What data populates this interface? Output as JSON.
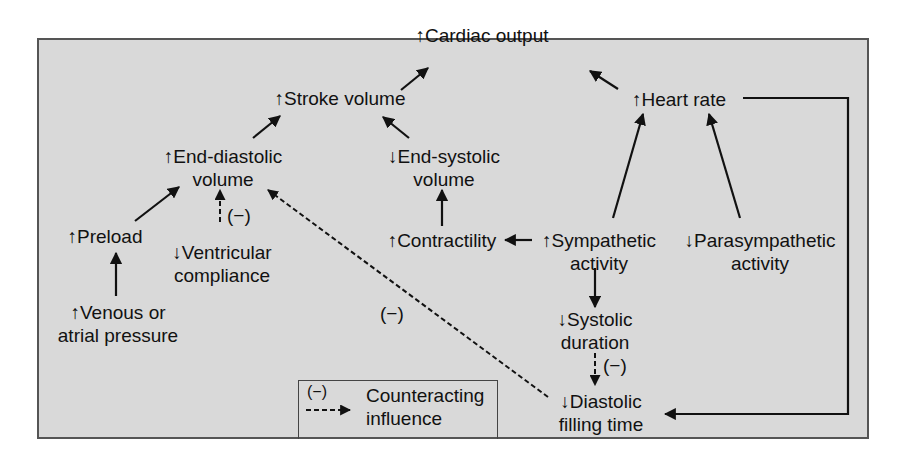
{
  "diagram": {
    "colors": {
      "background": "#d9d9d9",
      "frame_border": "#555555",
      "text": "#111111",
      "arrow": "#111111"
    },
    "nodes": {
      "cardiac_output": {
        "label": "↑Cardiac output"
      },
      "stroke_volume": {
        "label": "↑Stroke volume"
      },
      "heart_rate": {
        "label": "↑Heart rate"
      },
      "end_diastolic_volume": {
        "line1": "↑End-diastolic",
        "line2": "volume"
      },
      "end_systolic_volume": {
        "line1": "↓End-systolic",
        "line2": "volume"
      },
      "preload": {
        "label": "↑Preload"
      },
      "ventricular_compliance": {
        "line1": "↓Ventricular",
        "line2": "compliance"
      },
      "contractility": {
        "label": "↑Contractility"
      },
      "sympathetic_activity": {
        "line1": "↑Sympathetic",
        "line2": "activity"
      },
      "parasympathetic_activity": {
        "line1": "↓Parasympathetic",
        "line2": "activity"
      },
      "venous_pressure": {
        "line1": "↑Venous or",
        "line2": "atrial pressure"
      },
      "systolic_duration": {
        "line1": "↓Systolic",
        "line2": "duration"
      },
      "diastolic_filling_time": {
        "line1": "↓Diastolic",
        "line2": "filling time"
      }
    },
    "edges": [
      {
        "from": "stroke_volume",
        "to": "cardiac_output",
        "type": "solid"
      },
      {
        "from": "heart_rate",
        "to": "cardiac_output",
        "type": "solid"
      },
      {
        "from": "end_diastolic_volume",
        "to": "stroke_volume",
        "type": "solid"
      },
      {
        "from": "end_systolic_volume",
        "to": "stroke_volume",
        "type": "solid"
      },
      {
        "from": "preload",
        "to": "end_diastolic_volume",
        "type": "solid"
      },
      {
        "from": "ventricular_compliance",
        "to": "end_diastolic_volume",
        "type": "dashed",
        "label": "(−)"
      },
      {
        "from": "venous_pressure",
        "to": "preload",
        "type": "solid"
      },
      {
        "from": "contractility",
        "to": "end_systolic_volume",
        "type": "solid"
      },
      {
        "from": "sympathetic_activity",
        "to": "contractility",
        "type": "solid"
      },
      {
        "from": "sympathetic_activity",
        "to": "heart_rate",
        "type": "solid"
      },
      {
        "from": "parasympathetic_activity",
        "to": "heart_rate",
        "type": "solid"
      },
      {
        "from": "sympathetic_activity",
        "to": "systolic_duration",
        "type": "solid"
      },
      {
        "from": "systolic_duration",
        "to": "diastolic_filling_time",
        "type": "dashed",
        "label": "(−)"
      },
      {
        "from": "heart_rate",
        "to": "diastolic_filling_time",
        "type": "solid"
      },
      {
        "from": "diastolic_filling_time",
        "to": "end_diastolic_volume",
        "type": "dashed",
        "label": "(−)"
      }
    ],
    "negative_labels": {
      "compliance": "(−)",
      "filling_diagonal": "(−)",
      "systolic": "(−)"
    },
    "legend": {
      "symbol": "(−)",
      "line1": "Counteracting",
      "line2": "influence"
    }
  }
}
